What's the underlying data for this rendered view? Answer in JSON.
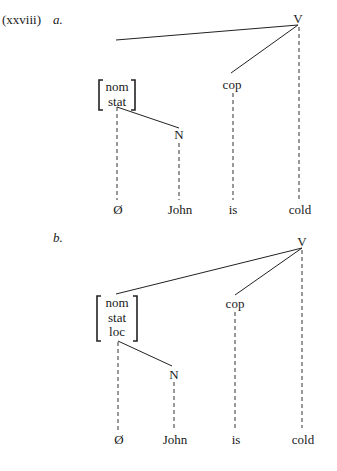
{
  "example_number": "(xxviii)",
  "trees": [
    {
      "label": "a.",
      "root": "V",
      "feature_bundle": [
        "nom",
        "stat"
      ],
      "copula": "cop",
      "noun_node": "N",
      "leaves": [
        "Ø",
        "John",
        "is",
        "cold"
      ]
    },
    {
      "label": "b.",
      "root": "V",
      "feature_bundle": [
        "nom",
        "stat",
        "loc"
      ],
      "copula": "cop",
      "noun_node": "N",
      "leaves": [
        "Ø",
        "John",
        "is",
        "cold"
      ]
    }
  ]
}
